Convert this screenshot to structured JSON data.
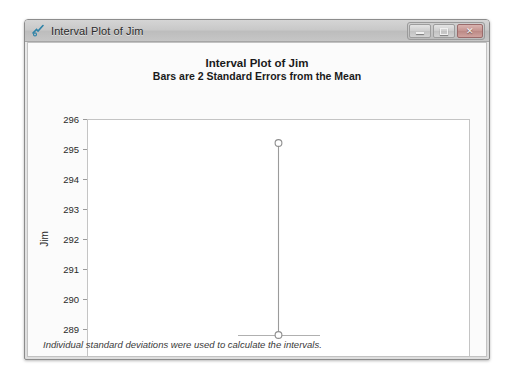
{
  "window": {
    "title": "Interval Plot of Jim",
    "icon": "minitab-graph-icon",
    "controls": {
      "minimize": "minimize-button",
      "maximize": "maximize-button",
      "close_label": "✕"
    }
  },
  "chart_data": {
    "type": "scatter",
    "title": "Interval Plot of Jim",
    "subtitle": "Bars are 2 Standard Errors from the Mean",
    "xlabel": "",
    "ylabel": "Jim",
    "ylim": [
      288,
      296
    ],
    "yticks": [
      288,
      289,
      290,
      291,
      292,
      293,
      294,
      295,
      296
    ],
    "ytick_labels": [
      "288",
      "289",
      "290",
      "291",
      "292",
      "293",
      "294",
      "295",
      "296"
    ],
    "grid": false,
    "legend": null,
    "categories": [
      "Jim"
    ],
    "series": [
      {
        "name": "Jim",
        "upper": 295.2,
        "lower": 288.8,
        "markers": [
          295.2,
          288.8
        ],
        "cap_at": 288.8
      }
    ],
    "footnote": "Individual standard deviations were used to calculate the intervals."
  }
}
